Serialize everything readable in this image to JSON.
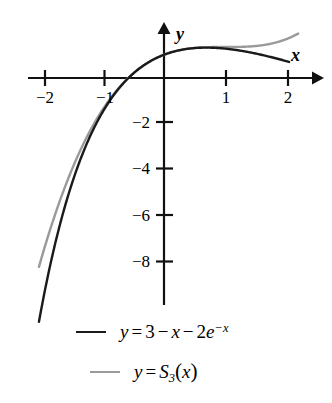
{
  "chart_data": {
    "type": "line",
    "title": "",
    "subtitle": "",
    "xlabel": "x",
    "ylabel": "y",
    "xlim": [
      -2.2,
      2.55
    ],
    "ylim": [
      -9.8,
      2.35
    ],
    "grid": false,
    "legend_position": "below",
    "axis_style": "arrowed-cartesian-axes",
    "xticks": [
      -2,
      -1,
      1,
      2
    ],
    "xtick_labels": [
      "−2",
      "−1",
      "1",
      "2"
    ],
    "yticks": [
      -2,
      -4,
      -6,
      -8
    ],
    "ytick_labels": [
      "−2",
      "−4",
      "−6",
      "−8"
    ],
    "origin_label": "",
    "series": [
      {
        "name": "y = 3 − x − 2e^(−x)",
        "color": "#1a1a1a",
        "formula_parts": {
          "lhs": "y",
          "eq": "=",
          "t1": "3",
          "op1": "−",
          "t2": "x",
          "op2": "−",
          "t3": "2",
          "base": "e",
          "exponent": "−x"
        },
        "x": [
          -2.05,
          -1.9,
          -1.75,
          -1.6,
          -1.45,
          -1.3,
          -1.15,
          -1.0,
          -0.85,
          -0.7,
          -0.55,
          -0.4,
          -0.25,
          -0.1,
          0.05,
          0.2,
          0.35,
          0.5,
          0.65,
          0.8,
          0.95,
          1.1,
          1.25,
          1.4,
          1.55,
          1.7,
          1.85,
          2.0
        ],
        "y": [
          -10.61,
          -9.29,
          -8.29,
          -7.51,
          -6.9,
          -6.04,
          -5.47,
          -5.44,
          -4.52,
          -3.73,
          -3.01,
          -2.38,
          -1.82,
          -1.31,
          -0.85,
          -0.44,
          -0.06,
          0.29,
          0.61,
          0.9,
          1.17,
          1.24,
          1.18,
          1.11,
          1.03,
          0.93,
          0.83,
          0.73
        ],
        "expression": "3 - x - 2*exp(-x)",
        "visible_range": [
          -2.05,
          2.05
        ]
      },
      {
        "name": "y = S3(x)",
        "color": "#9a9a9a",
        "formula_parts": {
          "lhs": "y",
          "eq": "=",
          "fn": "S",
          "sub": "3",
          "open": "(",
          "arg": "x",
          "close": ")"
        },
        "expression": "third-order Taylor/spline approximation",
        "visible_range": [
          -2.05,
          2.2
        ]
      }
    ],
    "annotations": []
  },
  "axes": {
    "x_axis_label": "x",
    "y_axis_label": "y"
  }
}
